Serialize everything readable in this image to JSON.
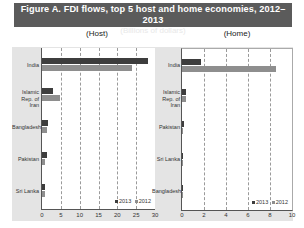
{
  "title": "Figure A. FDI flows, top 5 host and home economies, 2012–2013",
  "subtitle": "(Billions of dollars)",
  "legend": {
    "y2013": "2013",
    "y2012": "2012"
  },
  "colors": {
    "y2013": "#3d3d3d",
    "y2012": "#8e8e8e",
    "title_bg": "#5b5b5b"
  },
  "chart_data": [
    {
      "type": "bar",
      "orientation": "horizontal",
      "title": "(Host)",
      "categories": [
        "India",
        "Islamic Rep. of Iran",
        "Bangladesh",
        "Pakistan",
        "Sri Lanka"
      ],
      "series": [
        {
          "name": "2013",
          "values": [
            28.2,
            3.0,
            1.6,
            1.3,
            0.9
          ]
        },
        {
          "name": "2012",
          "values": [
            24.0,
            4.7,
            1.3,
            0.9,
            0.9
          ]
        }
      ],
      "xlim": [
        0,
        30
      ],
      "xticks": [
        "0",
        "5",
        "10",
        "15",
        "20",
        "25",
        "30"
      ],
      "grid": true,
      "legend_position": "bottom-right"
    },
    {
      "type": "bar",
      "orientation": "horizontal",
      "title": "(Home)",
      "categories": [
        "India",
        "Islamic Rep. of Iran",
        "Pakistan",
        "Sri Lanka",
        "Bangladesh"
      ],
      "series": [
        {
          "name": "2013",
          "values": [
            1.7,
            0.4,
            0.2,
            0.1,
            0.05
          ]
        },
        {
          "name": "2012",
          "values": [
            8.5,
            0.4,
            0.1,
            0.1,
            0.05
          ]
        }
      ],
      "xlim": [
        0,
        10
      ],
      "xticks": [
        "0",
        "2",
        "4",
        "6",
        "8",
        "10"
      ],
      "grid": true,
      "legend_position": "bottom-right"
    }
  ]
}
